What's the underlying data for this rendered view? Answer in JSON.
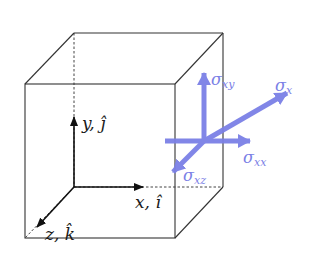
{
  "diagram": {
    "colors": {
      "edge": "#333333",
      "axis": "#111111",
      "stress": "#7b80e6"
    },
    "axes": {
      "y": {
        "label": "y, ĵ"
      },
      "x": {
        "label": "x, î"
      },
      "z": {
        "label": "z, k̂"
      }
    },
    "stresses": {
      "sxy": {
        "symbol": "σ",
        "sub": "xy"
      },
      "sx": {
        "symbol": "σ",
        "sub": "x"
      },
      "sxx": {
        "symbol": "σ",
        "sub": "xx"
      },
      "sxz": {
        "symbol": "σ",
        "sub": "xz"
      }
    }
  }
}
